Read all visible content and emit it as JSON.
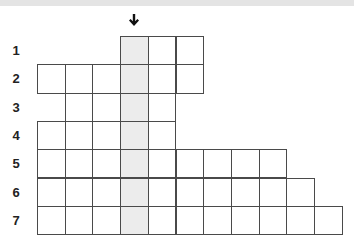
{
  "puzzle": {
    "type": "crossword-grid",
    "keyword_column": 4,
    "arrow_icon": "down-arrow-icon",
    "shade_color": "#ececec",
    "border_color": "#4a4a4a",
    "rows": [
      {
        "label": "1",
        "start_col": 4,
        "end_col": 6
      },
      {
        "label": "2",
        "start_col": 1,
        "end_col": 6
      },
      {
        "label": "3",
        "start_col": 2,
        "end_col": 5
      },
      {
        "label": "4",
        "start_col": 1,
        "end_col": 5
      },
      {
        "label": "5",
        "start_col": 1,
        "end_col": 9
      },
      {
        "label": "6",
        "start_col": 1,
        "end_col": 10
      },
      {
        "label": "7",
        "start_col": 1,
        "end_col": 11
      }
    ]
  }
}
